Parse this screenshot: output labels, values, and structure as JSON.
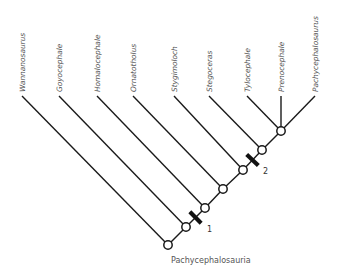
{
  "diagram": {
    "type": "cladogram",
    "root_label": "Pachycephalosauria",
    "line_color": "#1a1a1a",
    "text_color": "#555555",
    "taxa": [
      {
        "name": "Wannanosaurus",
        "tip": [
          22,
          96
        ],
        "node": 0
      },
      {
        "name": "Goyocephale",
        "tip": [
          59,
          96
        ],
        "node": 1
      },
      {
        "name": "Homalocephale",
        "tip": [
          97,
          96
        ],
        "node": 2
      },
      {
        "name": "Ornatotholus",
        "tip": [
          133,
          96
        ],
        "node": 3
      },
      {
        "name": "Stygimoloch",
        "tip": [
          174,
          96
        ],
        "node": 4
      },
      {
        "name": "Stegoceras",
        "tip": [
          209,
          96
        ],
        "node": 5
      },
      {
        "name": "Tylocephale",
        "tip": [
          247,
          96
        ],
        "node": 6
      },
      {
        "name": "Prenocephale",
        "tip": [
          281,
          96
        ],
        "node": 6
      },
      {
        "name": "Pachycephalosaurus",
        "tip": [
          315,
          96
        ],
        "node": 6
      }
    ],
    "nodes": [
      [
        168,
        245
      ],
      [
        186,
        227
      ],
      [
        205,
        208
      ],
      [
        223,
        189
      ],
      [
        243,
        170
      ],
      [
        262,
        150
      ],
      [
        281,
        131
      ]
    ],
    "synapomorphies": [
      {
        "label": "1",
        "between": [
          1,
          2
        ],
        "label_pos": [
          207,
          232
        ]
      },
      {
        "label": "2",
        "between": [
          4,
          5
        ],
        "label_pos": [
          263,
          174
        ]
      }
    ]
  }
}
